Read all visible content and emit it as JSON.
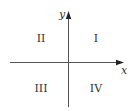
{
  "diagram": {
    "axes": {
      "x_label": "x",
      "y_label": "y"
    },
    "quadrants": [
      {
        "id": "I",
        "label": "I"
      },
      {
        "id": "II",
        "label": "II"
      },
      {
        "id": "III",
        "label": "III"
      },
      {
        "id": "IV",
        "label": "IV"
      }
    ],
    "colors": {
      "axis": "#444444",
      "text": "#333333",
      "background": "#ffffff"
    }
  }
}
